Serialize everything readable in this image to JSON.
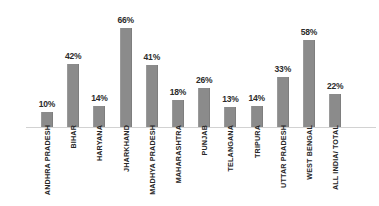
{
  "chart_data": {
    "type": "bar",
    "title": "",
    "subtitle": "",
    "xlabel": "",
    "ylabel": "",
    "ylim": [
      0,
      70
    ],
    "grid": false,
    "legend": "none",
    "value_suffix": "%",
    "bar_color": "#8b8b8b",
    "axis_color": "#d2d2d2",
    "background": "#ffffff",
    "categories": [
      "ANDHRA PRADESH",
      "BIHAR",
      "HARYANA",
      "JHARKHAND",
      "MADHYA PRADESH",
      "MAHARASHTRA",
      "PUNJAB",
      "TELANGANA",
      "TRIPURA",
      "UTTAR PRADESH",
      "WEST BENGAL",
      "ALL INDIA/ TOTAL"
    ],
    "values": [
      10,
      42,
      14,
      66,
      41,
      18,
      26,
      13,
      14,
      33,
      58,
      22
    ],
    "value_labels": [
      "10%",
      "42%",
      "14%",
      "66%",
      "41%",
      "18%",
      "26%",
      "13%",
      "14%",
      "33%",
      "58%",
      "22%"
    ]
  }
}
